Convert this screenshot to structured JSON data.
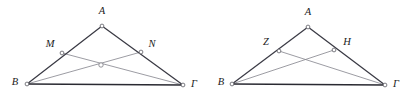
{
  "page": {
    "background_color": "#ffffff",
    "width": 412,
    "height": 106
  },
  "style": {
    "side_color": "#3a3a44",
    "base_color": "#2a2a32",
    "cevian_color": "#8a8a92",
    "node_fill": "#ffffff",
    "node_stroke": "#5a5a62",
    "label_color": "#1a1a1a"
  },
  "figures": [
    {
      "id": "figure-left",
      "name": "triangle-abg-with-mn",
      "points": {
        "A": {
          "label": "A",
          "x": 102,
          "y": 26,
          "label_x": 102,
          "label_y": 12
        },
        "B": {
          "label": "B",
          "x": 27,
          "y": 84,
          "label_x": 15,
          "label_y": 83
        },
        "G": {
          "label": "Γ",
          "x": 183,
          "y": 85,
          "label_x": 194,
          "label_y": 85
        },
        "M": {
          "label": "M",
          "x": 62,
          "y": 53,
          "label_x": 50,
          "label_y": 45
        },
        "N": {
          "label": "N",
          "x": 141,
          "y": 52,
          "label_x": 152,
          "label_y": 45
        },
        "O": {
          "label": "",
          "x": 101,
          "y": 65,
          "label_x": 101,
          "label_y": 65
        }
      },
      "sides": [
        {
          "name": "side-ab",
          "from": "A",
          "to": "B",
          "weight": "normal"
        },
        {
          "name": "side-ag",
          "from": "A",
          "to": "G",
          "weight": "normal"
        },
        {
          "name": "side-bg",
          "from": "B",
          "to": "G",
          "weight": "base"
        }
      ],
      "cevians": [
        {
          "name": "cevian-bn",
          "from": "B",
          "to": "N"
        },
        {
          "name": "cevian-gm",
          "from": "G",
          "to": "M"
        }
      ],
      "marked_nodes": [
        "A",
        "B",
        "G",
        "M",
        "N"
      ],
      "intersection_marker": {
        "name": "intersection-point-left",
        "x": 101,
        "y": 65,
        "r": 2.2,
        "visible": true
      }
    },
    {
      "id": "figure-right",
      "name": "triangle-abg-with-zh",
      "points": {
        "A": {
          "label": "A",
          "x": 308,
          "y": 27,
          "label_x": 308,
          "label_y": 13
        },
        "B": {
          "label": "B",
          "x": 232,
          "y": 84,
          "label_x": 221,
          "label_y": 83
        },
        "G": {
          "label": "Γ",
          "x": 385,
          "y": 85,
          "label_x": 396,
          "label_y": 85
        },
        "Z": {
          "label": "Z",
          "x": 279,
          "y": 51,
          "label_x": 266,
          "label_y": 43
        },
        "H": {
          "label": "H",
          "x": 334,
          "y": 50,
          "label_x": 347,
          "label_y": 43
        }
      },
      "sides": [
        {
          "name": "side-ab",
          "from": "A",
          "to": "B",
          "weight": "normal"
        },
        {
          "name": "side-ag",
          "from": "A",
          "to": "G",
          "weight": "normal"
        },
        {
          "name": "side-bg",
          "from": "B",
          "to": "G",
          "weight": "base"
        }
      ],
      "cevians": [
        {
          "name": "cevian-bh",
          "from": "B",
          "to": "H"
        },
        {
          "name": "cevian-gz",
          "from": "G",
          "to": "Z"
        }
      ],
      "marked_nodes": [
        "A",
        "B",
        "G",
        "Z",
        "H"
      ],
      "intersection_marker": {
        "name": "intersection-point-right",
        "x": 306,
        "y": 64,
        "r": 2.0,
        "visible": false
      }
    }
  ]
}
